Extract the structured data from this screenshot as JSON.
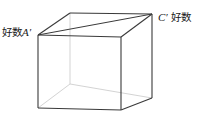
{
  "figure": {
    "background_color": "#ffffff",
    "labels": {
      "left_vertex": {
        "name": "label-a-prime",
        "cjk_text": "好数",
        "point_text": "A′",
        "order": "cjk-then-point",
        "full_text": "好数A′",
        "x": 2,
        "y": 27
      },
      "right_vertex": {
        "name": "label-c-prime",
        "cjk_text": "好数",
        "point_text": "C′",
        "order": "point-then-cjk",
        "full_text": "C′ 好数",
        "x": 158,
        "y": 12
      }
    },
    "colors": {
      "visible_edge": "#3a3a3a",
      "hidden_edge": "#c8c8c8",
      "diagonal_edge": "#3a3a3a",
      "text": "#1a1a1a"
    },
    "stroke_widths": {
      "visible_edge": 1.1,
      "hidden_edge": 0.8,
      "diagonal_edge": 1.0
    },
    "vertices": {
      "front_top_left": [
        38,
        35
      ],
      "front_top_right": [
        121,
        37
      ],
      "front_bottom_left": [
        38,
        108
      ],
      "front_bottom_right": [
        121,
        110
      ],
      "back_top_left": [
        70,
        13
      ],
      "back_top_right": [
        152,
        14
      ],
      "back_bottom_left": [
        70,
        84
      ],
      "back_bottom_right": [
        152,
        98
      ]
    },
    "edges": [
      {
        "name": "front-top",
        "from": "front_top_left",
        "to": "front_top_right",
        "visible": true
      },
      {
        "name": "front-bottom",
        "from": "front_bottom_left",
        "to": "front_bottom_right",
        "visible": true
      },
      {
        "name": "front-left",
        "from": "front_top_left",
        "to": "front_bottom_left",
        "visible": true
      },
      {
        "name": "front-right",
        "from": "front_top_right",
        "to": "front_bottom_right",
        "visible": true
      },
      {
        "name": "back-top",
        "from": "back_top_left",
        "to": "back_top_right",
        "visible": true
      },
      {
        "name": "top-left-slant",
        "from": "front_top_left",
        "to": "back_top_left",
        "visible": true
      },
      {
        "name": "top-right-slant",
        "from": "front_top_right",
        "to": "back_top_right",
        "visible": true
      },
      {
        "name": "right-side-bottom-slant",
        "from": "front_bottom_right",
        "to": "back_bottom_right",
        "visible": true
      },
      {
        "name": "back-right-vertical",
        "from": "back_top_right",
        "to": "back_bottom_right",
        "visible": true
      },
      {
        "name": "back-left-vertical-hidden",
        "from": "back_top_left",
        "to": "back_bottom_left",
        "visible": false
      },
      {
        "name": "back-bottom-hidden",
        "from": "back_bottom_left",
        "to": "back_bottom_right",
        "visible": false
      },
      {
        "name": "bottom-left-slant-hidden",
        "from": "front_bottom_left",
        "to": "back_bottom_left",
        "visible": false
      },
      {
        "name": "top-face-diagonal",
        "from": "front_top_left",
        "to": "back_top_right",
        "visible": true
      }
    ]
  }
}
